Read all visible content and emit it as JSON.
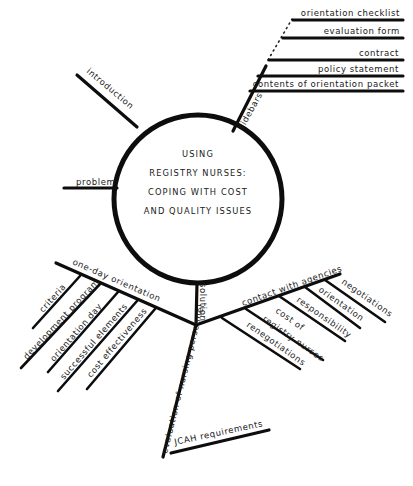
{
  "diagram": {
    "type": "mind-map",
    "center": {
      "lines": [
        "USING",
        "REGISTRY NURSES:",
        "COPING WITH COST",
        "AND QUALITY ISSUES"
      ]
    },
    "branches": {
      "introduction": "introduction",
      "problem": "problem",
      "sidebars": {
        "label": "sidebars",
        "items": [
          "orientation checklist",
          "evaluation form",
          "contract",
          "policy statement",
          "contents of orientation packet"
        ]
      },
      "solution": {
        "label": "solution",
        "one_day_orientation": {
          "label": "one-day orientation",
          "items": [
            "criteria",
            "development program",
            "orientation day",
            "successful elements",
            "cost effectiveness"
          ]
        },
        "contact_with_agencies": {
          "label": "contact with agencies",
          "items": [
            "negotiations",
            "orientation",
            "responsibility",
            "cost of registry nurses",
            "renegotiations"
          ],
          "cost_line1": "cost of",
          "cost_line2": "registry nurses"
        },
        "evaluation": {
          "label": "evaluation of nursing personnel",
          "items": [
            "JCAH requirements"
          ]
        }
      }
    }
  }
}
